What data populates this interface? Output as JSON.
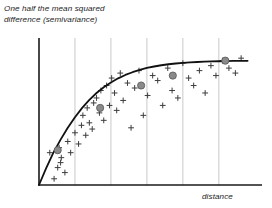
{
  "figure": {
    "y_axis_title": "One half the mean squared\ndifference (semivariance)",
    "x_axis_title": "distance"
  },
  "colors": {
    "axis": "#1a1a1a",
    "gridline": "#c9c9c9",
    "curve": "#111111",
    "cross_marker": "#3d3d3d",
    "bin_marker_fill": "#8a8a8a",
    "bin_marker_stroke": "#555555",
    "background": "#ffffff"
  },
  "chart_data": {
    "type": "scatter",
    "title": "",
    "subtitle": "",
    "xlabel": "distance",
    "ylabel": "One half the mean squared difference (semivariance)",
    "xlim": [
      0,
      6.2
    ],
    "ylim": [
      0,
      1.15
    ],
    "grid": true,
    "grid_axis": "x",
    "axis_ticks_shown": false,
    "tick_labels_x": [],
    "tick_labels_y": [],
    "legend": null,
    "legend_position": "none",
    "gridlines_x": [
      1,
      2,
      3,
      4,
      5
    ],
    "annotations": [],
    "series": [
      {
        "name": "empirical semivariance pairs",
        "type": "scatter",
        "marker": "plus",
        "x": [
          0.42,
          0.52,
          0.3,
          0.56,
          0.62,
          0.6,
          0.72,
          0.8,
          0.88,
          1.0,
          1.1,
          1.18,
          1.22,
          1.3,
          1.34,
          1.4,
          1.48,
          1.52,
          1.6,
          1.68,
          1.72,
          1.8,
          1.88,
          1.96,
          2.02,
          2.1,
          2.16,
          2.26,
          2.34,
          2.46,
          2.56,
          2.66,
          2.78,
          2.9,
          3.02,
          3.16,
          3.3,
          3.44,
          3.58,
          3.7,
          3.86,
          4.0,
          4.16,
          4.3,
          4.46,
          4.62,
          4.78,
          4.92,
          5.1,
          5.28,
          5.46,
          5.62
        ],
        "y": [
          0.05,
          0.14,
          0.26,
          0.3,
          0.22,
          0.18,
          0.1,
          0.35,
          0.26,
          0.42,
          0.33,
          0.48,
          0.56,
          0.4,
          0.62,
          0.5,
          0.45,
          0.66,
          0.7,
          0.58,
          0.76,
          0.52,
          0.8,
          0.64,
          0.86,
          0.74,
          0.6,
          0.9,
          0.68,
          0.82,
          0.46,
          0.78,
          0.92,
          0.56,
          0.72,
          0.88,
          0.84,
          0.64,
          0.94,
          0.76,
          0.7,
          0.98,
          0.86,
          0.8,
          0.92,
          0.74,
          0.96,
          0.88,
          1.0,
          0.94,
          0.9,
          1.02
        ]
      },
      {
        "name": "binned average semivariance",
        "type": "scatter",
        "marker": "circle",
        "x": [
          0.52,
          1.7,
          2.84,
          3.72,
          5.18
        ],
        "y": [
          0.28,
          0.62,
          0.8,
          0.88,
          1.0
        ]
      },
      {
        "name": "fitted model (exponential)",
        "type": "line",
        "nugget": 0.0,
        "sill": 1.0,
        "range": 4.6,
        "x": [
          0.0,
          0.2,
          0.4,
          0.6,
          0.8,
          1.0,
          1.2,
          1.4,
          1.6,
          1.8,
          2.0,
          2.2,
          2.4,
          2.6,
          2.8,
          3.0,
          3.2,
          3.4,
          3.6,
          3.8,
          4.0,
          4.2,
          4.4,
          4.6,
          4.8,
          5.0,
          5.2,
          5.4,
          5.6,
          5.8
        ],
        "y": [
          0.0,
          0.135,
          0.26,
          0.365,
          0.46,
          0.545,
          0.62,
          0.685,
          0.74,
          0.786,
          0.825,
          0.858,
          0.885,
          0.907,
          0.925,
          0.941,
          0.953,
          0.963,
          0.971,
          0.977,
          0.982,
          0.986,
          0.989,
          0.992,
          0.994,
          0.995,
          0.997,
          0.998,
          0.998,
          0.999
        ]
      }
    ]
  },
  "geometry": {
    "plot_left": 39,
    "plot_right": 262,
    "plot_top": 42,
    "plot_bottom": 185
  }
}
